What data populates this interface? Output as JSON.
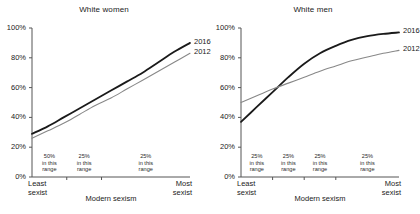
{
  "chart_data": [
    {
      "type": "line",
      "title": "White women",
      "xlabel": "Modern sexism",
      "ylabel": "",
      "ylim": [
        0,
        100
      ],
      "xlim": [
        0,
        100
      ],
      "grid": false,
      "legend_position": "right-of-line-ends",
      "ytick_labels": [
        "0%",
        "20%",
        "40%",
        "60%",
        "80%",
        "100%"
      ],
      "ytick_values": [
        0,
        20,
        40,
        60,
        80,
        100
      ],
      "x_axis_endpoints": [
        "Least sexist",
        "Most sexist"
      ],
      "x_axis_left_label_line1": "Least",
      "x_axis_left_label_line2": "sexist",
      "x_axis_right_label_line1": "Most",
      "x_axis_right_label_line2": "sexist",
      "bins": [
        {
          "pct": "50%",
          "line2": "in this",
          "line3": "range",
          "x_start": 0,
          "x_end": 22
        },
        {
          "pct": "25%",
          "line2": "in this",
          "line3": "range",
          "x_start": 22,
          "x_end": 44
        },
        {
          "pct": "25%",
          "line2": "in this",
          "line3": "range",
          "x_start": 44,
          "x_end": 100
        }
      ],
      "bin_tick_x": [
        22,
        44
      ],
      "series": [
        {
          "name": "2016",
          "color": "#1a1a1a",
          "width": 1.8,
          "x": [
            0,
            10,
            20,
            30,
            40,
            50,
            60,
            70,
            80,
            90,
            100
          ],
          "values": [
            29,
            34,
            40,
            46,
            52,
            58,
            64,
            70,
            77,
            84,
            90
          ]
        },
        {
          "name": "2012",
          "color": "#888888",
          "width": 1.1,
          "x": [
            0,
            10,
            20,
            30,
            40,
            50,
            60,
            70,
            80,
            90,
            100
          ],
          "values": [
            26,
            31,
            36,
            42,
            48,
            53,
            59,
            65,
            71,
            77,
            83
          ]
        }
      ]
    },
    {
      "type": "line",
      "title": "White men",
      "xlabel": "Modern sexism",
      "ylabel": "",
      "ylim": [
        0,
        100
      ],
      "xlim": [
        0,
        100
      ],
      "grid": false,
      "legend_position": "right-of-line-ends",
      "ytick_labels": [
        "0%",
        "20%",
        "40%",
        "60%",
        "80%",
        "100%"
      ],
      "ytick_values": [
        0,
        20,
        40,
        60,
        80,
        100
      ],
      "x_axis_endpoints": [
        "Least sexist",
        "Most sexist"
      ],
      "x_axis_left_label_line1": "Least",
      "x_axis_left_label_line2": "sexist",
      "x_axis_right_label_line1": "Most",
      "x_axis_right_label_line2": "sexist",
      "bins": [
        {
          "pct": "25%",
          "line2": "in this",
          "line3": "range",
          "x_start": 0,
          "x_end": 20
        },
        {
          "pct": "25%",
          "line2": "in this",
          "line3": "range",
          "x_start": 20,
          "x_end": 40
        },
        {
          "pct": "25%",
          "line2": "in this",
          "line3": "range",
          "x_start": 40,
          "x_end": 60
        },
        {
          "pct": "25%",
          "line2": "in this",
          "line3": "range",
          "x_start": 60,
          "x_end": 100
        }
      ],
      "bin_tick_x": [
        20,
        40,
        60
      ],
      "series": [
        {
          "name": "2016",
          "color": "#1a1a1a",
          "width": 1.8,
          "x": [
            0,
            10,
            20,
            30,
            40,
            50,
            60,
            70,
            80,
            90,
            100
          ],
          "values": [
            37,
            47,
            57,
            67,
            76,
            83,
            88,
            92,
            94.5,
            96,
            97
          ]
        },
        {
          "name": "2012",
          "color": "#888888",
          "width": 1.1,
          "x": [
            0,
            10,
            20,
            30,
            40,
            50,
            60,
            70,
            80,
            90,
            100
          ],
          "values": [
            50,
            54.5,
            59,
            63,
            67,
            71,
            74.5,
            78,
            80.5,
            83,
            85
          ]
        }
      ]
    }
  ]
}
